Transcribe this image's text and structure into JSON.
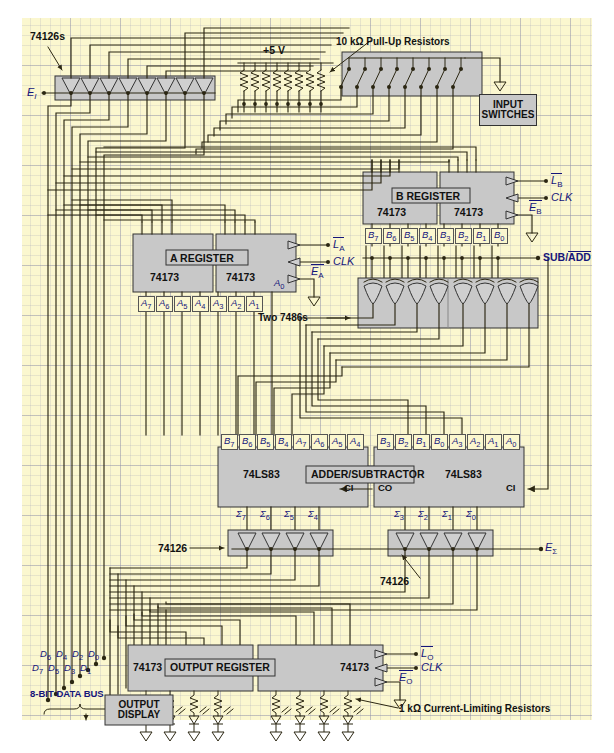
{
  "diagram": {
    "colors": {
      "paper": "#fbf7cf",
      "block": "#c8c8c8",
      "wire": "#2b2612",
      "label_blue": "#15157a"
    }
  },
  "annotations": {
    "input_buffers_label": "74126s",
    "e_in": "E",
    "e_in_sub": "I",
    "supply": "+5 V",
    "pullups": "10 kΩ Pull-Up Resistors",
    "input_switches_l1": "INPUT",
    "input_switches_l2": "SWITCHES",
    "xor_label": "Two 7486s",
    "sub_add": "SUB/ADD",
    "sum_buf_left": "74126",
    "sum_buf_right": "74126",
    "e_sigma": "E",
    "e_sigma_sub": "Σ",
    "data_bus": "8-BIT DATA BUS",
    "output_display_l1": "OUTPUT",
    "output_display_l2": "DISPLAY",
    "current_limiting": "1 kΩ Current-Limiting Resistors"
  },
  "blocks": {
    "a_register": {
      "name": "A REGISTER",
      "chip_left": "74173",
      "chip_right": "74173",
      "controls": [
        {
          "label": "L",
          "sub": "A",
          "bar": true
        },
        {
          "label": "CLK",
          "sub": "",
          "bar": false
        },
        {
          "label": "E",
          "sub": "A",
          "bar": true
        }
      ],
      "bit_labels": [
        "A7",
        "A6",
        "A5",
        "A4",
        "A3",
        "A2",
        "A1"
      ],
      "extra_bit": "A0"
    },
    "b_register": {
      "name": "B REGISTER",
      "chip_left": "74173",
      "chip_right": "74173",
      "controls": [
        {
          "label": "L",
          "sub": "B",
          "bar": true
        },
        {
          "label": "CLK",
          "sub": "",
          "bar": false
        },
        {
          "label": "E",
          "sub": "B",
          "bar": true
        }
      ],
      "bit_labels": [
        "B7",
        "B6",
        "B5",
        "B4",
        "B3",
        "B2",
        "B1",
        "B0"
      ]
    },
    "adder": {
      "name": "ADDER/SUBTRACTOR",
      "chip_left": "74LS83",
      "chip_right": "74LS83",
      "inputs_left": [
        "B7",
        "B6",
        "B5",
        "B4",
        "A7",
        "A6",
        "A5",
        "A4"
      ],
      "inputs_right": [
        "B3",
        "B2",
        "B1",
        "B0",
        "A3",
        "A2",
        "A1",
        "A0"
      ],
      "sums_left": [
        "Σ7",
        "Σ6",
        "Σ5",
        "Σ4"
      ],
      "sums_right": [
        "Σ3",
        "Σ2",
        "Σ1",
        "Σ0"
      ],
      "carry_in_left": "CI",
      "carry_out_left": "CO",
      "carry_in_right": "CI"
    },
    "output_register": {
      "name": "OUTPUT REGISTER",
      "chip_left": "74173",
      "chip_right": "74173",
      "controls": [
        {
          "label": "L",
          "sub": "O",
          "bar": true
        },
        {
          "label": "CLK",
          "sub": "",
          "bar": false
        },
        {
          "label": "E",
          "sub": "O",
          "bar": true
        }
      ]
    }
  },
  "bus": {
    "top_labels": [
      "D6",
      "D4",
      "D2",
      "D0"
    ],
    "bottom_labels": [
      "D7",
      "D5",
      "D3",
      "D1"
    ]
  },
  "counts": {
    "input_buffers": 8,
    "pullup_resistors": 8,
    "switches": 8,
    "xor_gates": 8,
    "sum_buffers_per_group": 4,
    "leds_per_group": 4
  }
}
